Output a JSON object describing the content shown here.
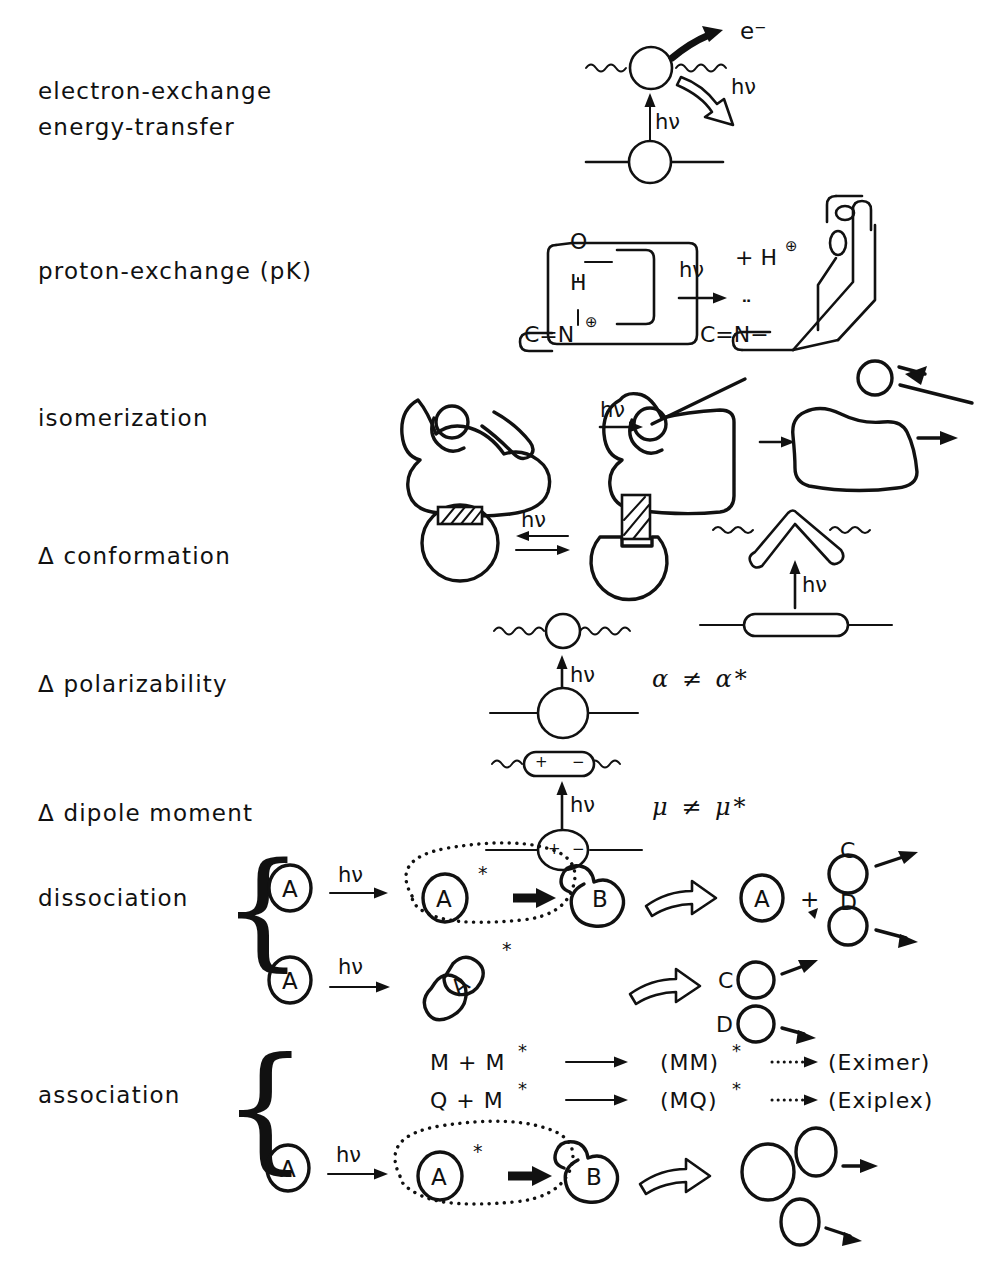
{
  "page": {
    "width": 990,
    "height": 1268,
    "background": "#ffffff",
    "ink_color": "#111111",
    "title": ""
  },
  "rows": [
    {
      "id": "electron-exchange",
      "label_lines": [
        "electron-exchange",
        "energy-transfer"
      ],
      "annotations": [
        "e⁻",
        "hν",
        "hν"
      ]
    },
    {
      "id": "proton-exchange",
      "label_lines": [
        "proton-exchange (pK)"
      ],
      "annotations": [
        "O",
        "H",
        "C=N",
        "hν",
        "+ H",
        "O",
        "C=N−"
      ]
    },
    {
      "id": "isomerization",
      "label_lines": [
        "isomerization"
      ],
      "annotations": [
        "hν"
      ]
    },
    {
      "id": "conformation",
      "label_lines": [
        "Δ conformation"
      ],
      "annotations": [
        "hν",
        "hν"
      ]
    },
    {
      "id": "polarizability",
      "label_lines": [
        "Δ polarizability"
      ],
      "annotations": [
        "hν"
      ],
      "relation": "α ≠ α*"
    },
    {
      "id": "dipole-moment",
      "label_lines": [
        "Δ dipole moment"
      ],
      "annotations": [
        "hν"
      ],
      "relation": "μ ≠ μ*"
    },
    {
      "id": "dissociation",
      "label_lines": [
        "dissociation"
      ],
      "has_brace": true,
      "annotations": [
        "A",
        "hν",
        "A",
        "B",
        "A",
        "+",
        "C",
        "D",
        "A",
        "hν",
        "A",
        "C",
        "D"
      ]
    },
    {
      "id": "association",
      "label_lines": [
        "association"
      ],
      "has_brace": true,
      "annotations": [
        "A",
        "hν",
        "A",
        "B"
      ]
    }
  ],
  "labels": {
    "electron_exchange": "electron-exchange",
    "energy_transfer": "energy-transfer",
    "proton_exchange": "proton-exchange (pK)",
    "isomerization": "isomerization",
    "conformation": "Δ conformation",
    "polarizability": "Δ polarizability",
    "dipole_moment": "Δ dipole moment",
    "dissociation": "dissociation",
    "association": "association"
  },
  "photon": {
    "symbol": "hν"
  },
  "electron_exchange_row": {
    "electron_label": "e⁻",
    "excitation_photon": "hν",
    "emission_photon": "hν"
  },
  "proton_exchange_row": {
    "oxygen_left": "O",
    "hydrogen": "H",
    "imine_left": "C=N",
    "imine_charge": "⊕",
    "arrow_photon": "hν",
    "released_proton": "+ H",
    "released_proton_charge": "⊕",
    "oxygen_right": "O",
    "imine_right": "C=N−",
    "lone_pair": "¨"
  },
  "isomerization_row": {
    "photon": "hν"
  },
  "conformation_row": {
    "photon_left": "hν",
    "photon_right": "hν"
  },
  "polarizability_row": {
    "photon": "hν",
    "ground_symbol": "α",
    "not_equal": "≠",
    "excited_symbol": "α",
    "excited_star": "*",
    "relation": "α ≠ α*"
  },
  "dipole_row": {
    "photon": "hν",
    "ground_symbol": "μ",
    "not_equal": "≠",
    "excited_symbol": "μ",
    "excited_star": "*",
    "relation": "μ ≠ μ*",
    "plus_sign": "+",
    "minus_sign": "−"
  },
  "dissociation_row": {
    "line1": {
      "reactant": "A",
      "photon": "hν",
      "excited": "A",
      "excited_star": "*",
      "product_b": "B",
      "result_a": "A",
      "plus": "+",
      "fragment_c": "C",
      "fragment_d": "D"
    },
    "line2": {
      "reactant": "A",
      "photon": "hν",
      "excited": "A",
      "excited_star": "*",
      "fragment_c": "C",
      "fragment_d": "D"
    }
  },
  "association_row": {
    "equations": [
      {
        "reactants": "M  +  M",
        "reactant_star": "*",
        "complex": "(MM)",
        "complex_star": "*",
        "product": "(Eximer)"
      },
      {
        "reactants": "Q  +  M",
        "reactant_star": "*",
        "complex": "(MQ)",
        "complex_star": "*",
        "product": "(Exiplex)"
      }
    ],
    "scheme": {
      "reactant": "A",
      "photon": "hν",
      "excited": "A",
      "excited_star": "*",
      "product_b": "B"
    }
  },
  "brace_glyph": "{"
}
